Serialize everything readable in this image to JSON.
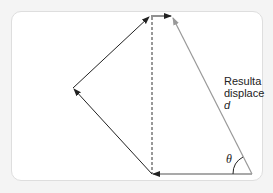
{
  "diagram": {
    "type": "vector-addition",
    "label_line1": "Resulta",
    "label_line2": "displace",
    "label_symbol": "d",
    "angle_symbol": "θ",
    "colors": {
      "vector": "#222222",
      "resultant": "#999999",
      "dashed": "#333333",
      "panel_border": "#dedede",
      "background": "#f4f4f4"
    },
    "vectors": [
      {
        "name": "vector-1",
        "from": [
          252,
          174
        ],
        "to": [
          152,
          174
        ]
      },
      {
        "name": "vector-2",
        "from": [
          152,
          174
        ],
        "to": [
          73,
          88
        ]
      },
      {
        "name": "vector-3",
        "from": [
          73,
          88
        ],
        "to": [
          149,
          17
        ]
      },
      {
        "name": "vector-4",
        "from": [
          151,
          16
        ],
        "to": [
          171,
          16
        ]
      },
      {
        "name": "resultant",
        "from": [
          252,
          174
        ],
        "to": [
          172,
          17
        ]
      }
    ]
  }
}
